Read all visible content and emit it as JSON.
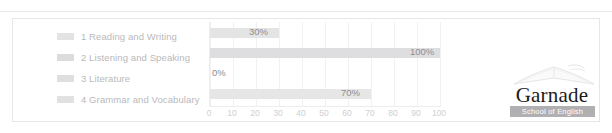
{
  "chart_data": {
    "type": "bar",
    "orientation": "horizontal",
    "title": "",
    "xlabel": "",
    "ylabel": "",
    "categories": [
      "1 Reading and Writing",
      "2 Listening and Speaking",
      "3 Literature",
      "4 Grammar and Vocabulary"
    ],
    "values": [
      30,
      100,
      0,
      70
    ],
    "value_labels": [
      "30%",
      "100%",
      "0%",
      "70%"
    ],
    "xlim": [
      0,
      100
    ],
    "xticks": [
      0,
      10,
      20,
      30,
      40,
      50,
      60,
      70,
      80,
      90,
      100
    ],
    "xtick_labels": [
      "0",
      "10",
      "20",
      "30",
      "40",
      "50",
      "60",
      "70",
      "80",
      "90",
      "100"
    ],
    "grid": true,
    "legend_position": "left",
    "series": [
      {
        "name": "1 Reading and Writing",
        "value": 30,
        "label": "30%",
        "color": "#e4e4e5"
      },
      {
        "name": "2 Listening and Speaking",
        "value": 100,
        "label": "100%",
        "color": "#dedee0"
      },
      {
        "name": "3 Literature",
        "value": 0,
        "label": "0%",
        "color": "#e4e4e5"
      },
      {
        "name": "4 Grammar and Vocabulary",
        "value": 70,
        "label": "70%",
        "color": "#e6e6e7"
      }
    ]
  },
  "legend": {
    "items": [
      {
        "label": "1 Reading and Writing"
      },
      {
        "label": "2 Listening and Speaking"
      },
      {
        "label": "3 Literature"
      },
      {
        "label": "4 Grammar and Vocabulary"
      }
    ]
  },
  "logo": {
    "wordmark": "Garnade",
    "tagline": "School of English"
  },
  "colors": {
    "card_border": "#e6e6e7",
    "plot_border": "#ededee",
    "gridline": "#f1f1f2",
    "bar": "#e4e4e5",
    "legend_text": "#b9b9bb",
    "value_text": "#8d8d90",
    "tick_text": "#cfcfd1",
    "logo_bar": "#b0b0b2"
  }
}
